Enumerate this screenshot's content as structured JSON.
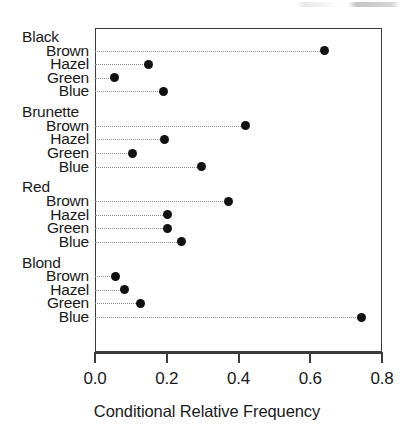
{
  "chart_data": {
    "type": "scatter",
    "subtype": "cleveland-dot-plot",
    "title": "",
    "xlabel": "Conditional Relative Frequency",
    "ylabel": "",
    "xlim": [
      0.0,
      0.8
    ],
    "xticks": [
      "0.0",
      "0.2",
      "0.4",
      "0.6",
      "0.8"
    ],
    "xtick_values": [
      0.0,
      0.2,
      0.4,
      0.6,
      0.8
    ],
    "grid": false,
    "legend": "none",
    "leader_lines": "dotted",
    "marker": "filled-circle",
    "marker_color": "#111111",
    "frame_color": "#3b3b3b",
    "groups": [
      {
        "name": "Black",
        "categories": [
          "Brown",
          "Hazel",
          "Green",
          "Blue"
        ],
        "values": [
          0.64,
          0.148,
          0.053,
          0.19
        ]
      },
      {
        "name": "Brunette",
        "categories": [
          "Brown",
          "Hazel",
          "Green",
          "Blue"
        ],
        "values": [
          0.42,
          0.195,
          0.104,
          0.298
        ]
      },
      {
        "name": "Red",
        "categories": [
          "Brown",
          "Hazel",
          "Green",
          "Blue"
        ],
        "values": [
          0.371,
          0.203,
          0.203,
          0.242
        ]
      },
      {
        "name": "Blond",
        "categories": [
          "Brown",
          "Hazel",
          "Green",
          "Blue"
        ],
        "values": [
          0.056,
          0.081,
          0.128,
          0.742
        ]
      }
    ]
  },
  "axis": {
    "x_title": "Conditional Relative Frequency"
  }
}
